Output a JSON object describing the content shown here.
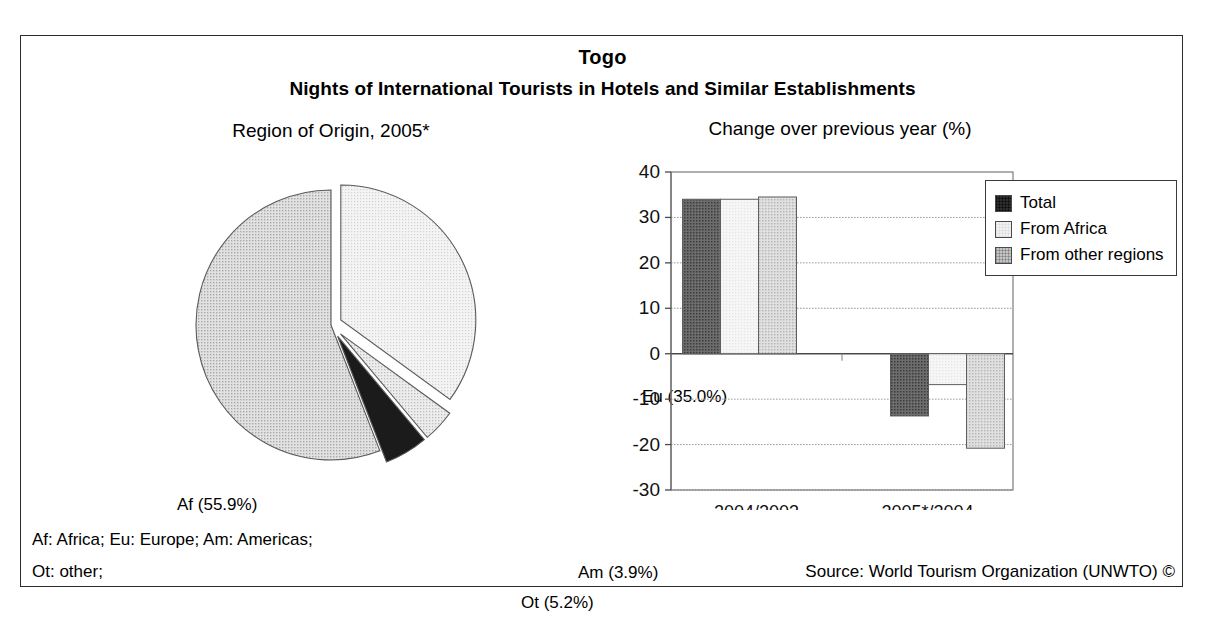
{
  "title": {
    "country": "Togo",
    "subtitle": "Nights of International Tourists in Hotels and Similar Establishments"
  },
  "pie_caption": "Region of Origin, 2005*",
  "bar_caption": "Change over previous year (%)",
  "legend": {
    "items": [
      {
        "label": "Total",
        "color": "#595959"
      },
      {
        "label": "From Africa",
        "color": "#f2f2f2"
      },
      {
        "label": "From other regions",
        "color": "#cfcfcf"
      }
    ]
  },
  "notes": {
    "line1": "Af: Africa; Eu: Europe; Am: Americas;",
    "line2": "Ot: other;",
    "source": "Source: World Tourism Organization (UNWTO) ©"
  },
  "pie_labels": {
    "af": "Af (55.9%)",
    "eu": "Eu (35.0%)",
    "am": "Am (3.9%)",
    "ot": "Ot (5.2%)"
  },
  "axis": {
    "ticks": [
      "40",
      "30",
      "20",
      "10",
      "0",
      "-10",
      "-20",
      "-30"
    ],
    "categories": [
      "2004/2003",
      "2005*/2004"
    ]
  },
  "chart_data": [
    {
      "type": "pie",
      "title": "Region of Origin, 2005*",
      "labels": [
        "Eu",
        "Am",
        "Ot",
        "Af"
      ],
      "label_texts": [
        "Eu (35.0%)",
        "Am (3.9%)",
        "Ot (5.2%)",
        "Af (55.9%)"
      ],
      "values": [
        35.0,
        3.9,
        5.2,
        55.9
      ],
      "unit": "%",
      "colors": [
        "#f0f0f0",
        "#d8d8d8",
        "#1a1a1a",
        "#d0d0d0"
      ],
      "exploded": [
        "Eu",
        "Am",
        "Ot"
      ],
      "start_angle_deg": 0,
      "direction": "clockwise",
      "legend": "none"
    },
    {
      "type": "bar",
      "title": "Change over previous year (%)",
      "xlabel": "",
      "ylabel": "",
      "categories": [
        "2004/2003",
        "2005*/2004"
      ],
      "series": [
        {
          "name": "Total",
          "values": [
            34.0,
            -13.7
          ],
          "color": "#595959"
        },
        {
          "name": "From Africa",
          "values": [
            34.0,
            -6.8
          ],
          "color": "#f2f2f2"
        },
        {
          "name": "From other regions",
          "values": [
            34.5,
            -20.8
          ],
          "color": "#cfcfcf"
        }
      ],
      "ylim": [
        -30,
        40
      ],
      "ytick_step": 10,
      "yticks": [
        40,
        30,
        20,
        10,
        0,
        -10,
        -20,
        -30
      ],
      "grid": "horizontal",
      "legend_position": "right"
    }
  ]
}
